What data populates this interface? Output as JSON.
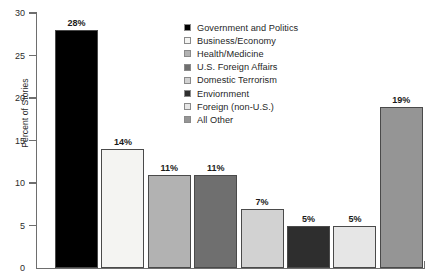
{
  "chart_data": {
    "type": "bar",
    "title": "",
    "xlabel": "",
    "ylabel": "Percent of Stories",
    "ylim": [
      0,
      30
    ],
    "ytick_values": [
      0,
      5,
      10,
      15,
      20,
      25,
      30
    ],
    "ytick_labels": [
      "0",
      "5",
      "10",
      "15",
      "20",
      "25",
      "30"
    ],
    "grid": false,
    "legend_position": "top-right",
    "categories": [
      "Government and Politics",
      "Business/Economy",
      "Health/Medicine",
      "U.S. Foreign Affairs",
      "Domestic Terrorism",
      "Enviornment",
      "Foreign (non-U.S.)",
      "All Other"
    ],
    "values": [
      28,
      14,
      11,
      11,
      7,
      5,
      5,
      19
    ],
    "data_labels": [
      "28%",
      "14%",
      "11%",
      "11%",
      "7%",
      "5%",
      "5%",
      "19%"
    ],
    "colors": [
      "#000000",
      "#f4f4f2",
      "#b2b2b2",
      "#6f6f6f",
      "#d2d2d2",
      "#2e2e2e",
      "#e6e6e6",
      "#959595"
    ]
  },
  "legend": {
    "items": [
      {
        "label": "Government and Politics",
        "color": "#000000"
      },
      {
        "label": "Business/Economy",
        "color": "#f4f4f2"
      },
      {
        "label": "Health/Medicine",
        "color": "#b2b2b2"
      },
      {
        "label": "U.S. Foreign Affairs",
        "color": "#6f6f6f"
      },
      {
        "label": "Domestic Terrorism",
        "color": "#d2d2d2"
      },
      {
        "label": "Enviornment",
        "color": "#2e2e2e"
      },
      {
        "label": "Foreign (non-U.S.)",
        "color": "#e6e6e6"
      },
      {
        "label": "All Other",
        "color": "#959595"
      }
    ]
  },
  "axis_style": {
    "line_color": "#6e6e6e",
    "text_color": "#2b2b2b"
  }
}
